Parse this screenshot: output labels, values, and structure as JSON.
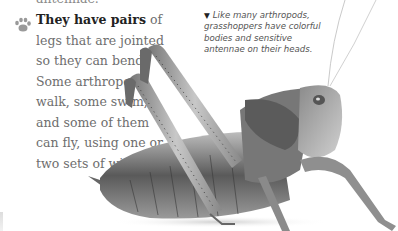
{
  "page": {
    "cut_off_text": "antennae.",
    "paragraph": {
      "bold_lead": "They have pairs",
      "rest": " of legs that are jointed so they can bend. Some arthropods walk, some swim, and some of them can fly, using one or two sets of wings.",
      "bullet_icon": "paw-print-icon"
    },
    "caption": {
      "marker": "▼",
      "text": "Like many arthropods, grasshoppers have colorful bodies and sensitive antennae on their heads."
    },
    "image": {
      "subject": "grasshopper",
      "tone": "grayscale"
    }
  }
}
